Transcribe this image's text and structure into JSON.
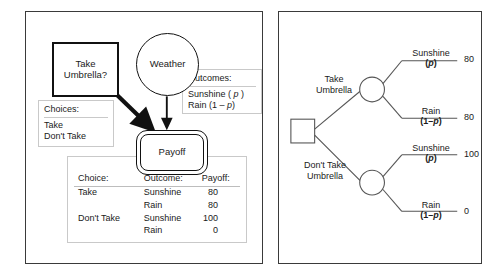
{
  "figure": {
    "panels": [
      {
        "id": "influence-diagram",
        "nodes": {
          "decision": "Take\nUmbrella?",
          "decision_line1": "Take",
          "decision_line2": "Umbrella?",
          "chance": "Weather",
          "payoff": "Payoff"
        },
        "choices_box": {
          "header": "Choices:",
          "items": [
            "Take",
            "Don't Take"
          ]
        },
        "outcomes_box": {
          "header": "Outcomes:",
          "items": [
            "Sunshine ( p )",
            "Rain (1 – p)"
          ],
          "item1_prefix": "Sunshine ( ",
          "item1_var": "p",
          "item1_suffix": " )",
          "item2_prefix": "Rain (1 – ",
          "item2_var": "p",
          "item2_suffix": ")"
        },
        "table": {
          "headers": [
            "Choice:",
            "Outcome:",
            "Payoff:"
          ],
          "rows": [
            [
              "Take",
              "Sunshine",
              "80"
            ],
            [
              "",
              "Rain",
              "80"
            ],
            [
              "Don't Take",
              "Sunshine",
              "100"
            ],
            [
              "",
              "Rain",
              "0"
            ]
          ]
        }
      },
      {
        "id": "decision-tree",
        "branches": {
          "upper_decision_line1": "Take",
          "upper_decision_line2": "Umbrella",
          "lower_decision_line1": "Don't Take",
          "lower_decision_line2": "Umbrella"
        },
        "outcome_branches": [
          {
            "name": "Sunshine",
            "prob_prefix": "(",
            "prob_var": "p",
            "prob_suffix": ")",
            "payoff": "80"
          },
          {
            "name": "Rain",
            "prob_prefix": "(1–",
            "prob_var": "p",
            "prob_suffix": ")",
            "payoff": "80"
          },
          {
            "name": "Sunshine",
            "prob_prefix": "(",
            "prob_var": "p",
            "prob_suffix": ")",
            "payoff": "100"
          },
          {
            "name": "Rain",
            "prob_prefix": "(1–",
            "prob_var": "p",
            "prob_suffix": ")",
            "payoff": "0"
          }
        ]
      }
    ]
  },
  "colors": {
    "panel_border": "#3a3a3a",
    "node_stroke": "#111111",
    "annot_border": "#c9c9c9",
    "text": "#1a1a1a"
  }
}
